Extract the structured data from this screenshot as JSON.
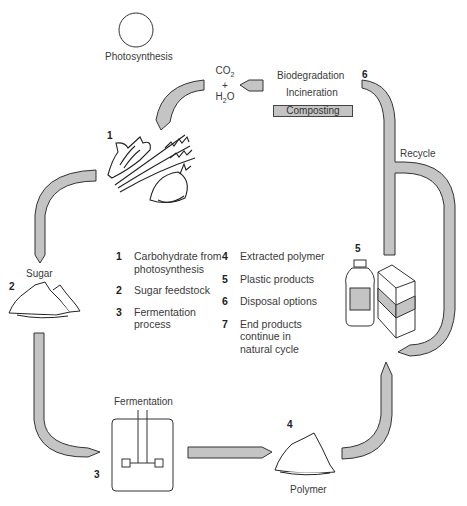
{
  "diagram": {
    "title_node": "Photosynthesis",
    "inputs": {
      "co2": "CO",
      "co2_sub": "2",
      "plus": "+",
      "h2o_pre": "H",
      "h2o_sub": "2",
      "h2o_post": "O"
    },
    "disposal": {
      "biodegradation": "Biodegradation",
      "incineration": "Incineration",
      "composting": "Composting"
    },
    "recycle_label": "Recycle",
    "sugar_label": "Sugar",
    "fermentation_label": "Fermentation",
    "polymer_label": "Polymer",
    "step_numbers": {
      "n1": "1",
      "n2": "2",
      "n3": "3",
      "n4": "4",
      "n5": "5",
      "n6": "6"
    },
    "arrow_fill": "#c4c4c4",
    "stroke": "#333333"
  },
  "legend": {
    "left": [
      {
        "num": "1",
        "text": "Carbohydrate from\nphotosynthesis"
      },
      {
        "num": "2",
        "text": "Sugar feedstock"
      },
      {
        "num": "3",
        "text": "Fermentation\nprocess"
      }
    ],
    "right": [
      {
        "num": "4",
        "text": "Extracted polymer"
      },
      {
        "num": "5",
        "text": "Plastic products"
      },
      {
        "num": "6",
        "text": "Disposal options"
      },
      {
        "num": "7",
        "text": "End products\ncontinue in\nnatural cycle"
      }
    ]
  }
}
